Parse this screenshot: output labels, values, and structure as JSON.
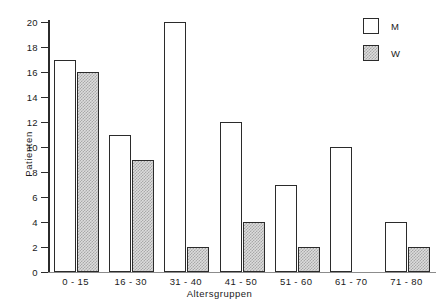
{
  "chart_data": {
    "type": "bar",
    "title": "",
    "xlabel": "Altersgruppen",
    "ylabel": "Patienten",
    "categories": [
      "0-15",
      "16-30",
      "31-40",
      "41-50",
      "51-60",
      "61-70",
      "71-80"
    ],
    "series": [
      {
        "name": "M",
        "values": [
          17,
          11,
          20,
          12,
          7,
          10,
          4
        ]
      },
      {
        "name": "W",
        "values": [
          16,
          9,
          2,
          4,
          2,
          0,
          2
        ]
      }
    ],
    "ylim": [
      0,
      20
    ],
    "ytick_values": [
      0,
      2,
      4,
      6,
      8,
      10,
      12,
      14,
      16,
      18,
      20
    ],
    "ytick_labels": [
      "0",
      "2",
      "4",
      "6",
      "8",
      "10",
      "12",
      "14",
      "16",
      "18",
      "20"
    ],
    "grid": false,
    "legend_position": "top-right",
    "legend": [
      {
        "label": "M",
        "swatch": "white-outlined"
      },
      {
        "label": "W",
        "swatch": "hatched-gray"
      }
    ],
    "colors": {
      "axis": "#2b2b2b",
      "bar_outline": "#2b2b2b",
      "series_m_fill": "#ffffff",
      "series_w_fill": "#dcdcdc",
      "background": "#ffffff"
    }
  }
}
